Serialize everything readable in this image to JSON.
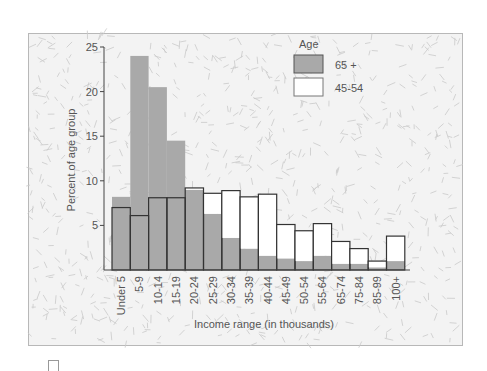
{
  "chart_data": {
    "type": "bar",
    "title": "",
    "xlabel": "Income range (in thousands)",
    "ylabel": "Percent of age group",
    "ylim": [
      0,
      25
    ],
    "yticks": [
      5,
      10,
      15,
      20,
      25
    ],
    "grid": false,
    "legend": {
      "title": "Age",
      "position": "upper right"
    },
    "categories": [
      "Under 5",
      "5-9",
      "10-14",
      "15-19",
      "20-24",
      "25-29",
      "30-34",
      "35-39",
      "40-44",
      "45-49",
      "50-54",
      "55-64",
      "65-74",
      "75-84",
      "85-99",
      "100+"
    ],
    "series": [
      {
        "name": "65 +",
        "color": "#a9a9a9",
        "values": [
          8.2,
          24.0,
          20.5,
          14.5,
          9.0,
          6.3,
          3.6,
          2.4,
          1.6,
          1.3,
          1.0,
          1.6,
          0.7,
          0.7,
          0.3,
          1.0
        ]
      },
      {
        "name": "45-54",
        "color": "#ffffff",
        "values": [
          7.0,
          6.1,
          8.1,
          8.1,
          9.2,
          8.6,
          8.9,
          8.2,
          8.5,
          5.1,
          4.4,
          5.2,
          3.2,
          2.4,
          1.0,
          3.8
        ]
      }
    ]
  }
}
